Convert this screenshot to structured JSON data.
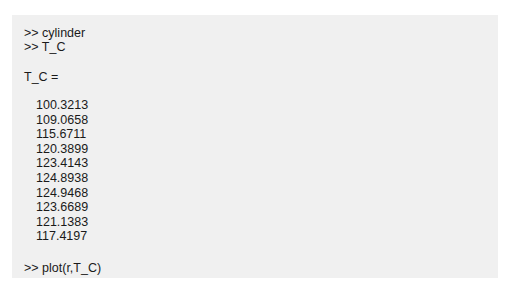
{
  "console": {
    "commands": [
      {
        "prompt": ">>",
        "text": "cylinder"
      },
      {
        "prompt": ">>",
        "text": "T_C"
      }
    ],
    "output_label": "T_C =",
    "values": [
      "100.3213",
      "109.0658",
      "115.6711",
      "120.3899",
      "123.4143",
      "124.8938",
      "124.9468",
      "123.6689",
      "121.1383",
      "117.4197"
    ],
    "final_command": {
      "prompt": ">>",
      "text": "plot(r,T_C)"
    }
  },
  "lines": {
    "cmd1": ">> cylinder",
    "cmd2": ">> T_C",
    "label": "T_C =",
    "cmd3": ">> plot(r,T_C)"
  }
}
